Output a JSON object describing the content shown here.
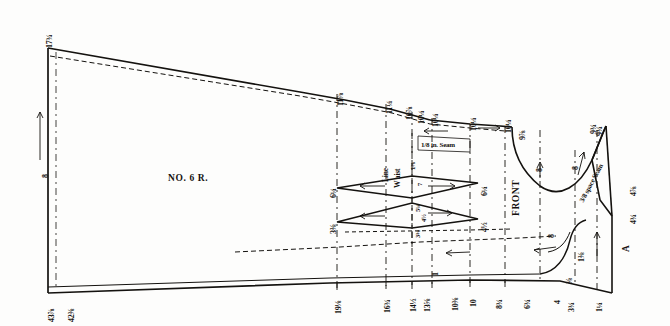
{
  "drawing": {
    "type": "tailoring-pattern-draft",
    "caption_text": "NO. 6 R.",
    "front_label": "FRONT",
    "waist_line_label_1": "W aist",
    "waist_line_label_2": "Line",
    "seam_label_top": "1/8 in. Seam",
    "seam_label_right": "3/8 space Seam",
    "point_a": "A"
  },
  "measurements": {
    "top_left": "17¾",
    "left_vertical": "8",
    "bottom_left_a": "43⅞",
    "bottom_left_b": "42⅜",
    "top_scale": [
      "11⅞",
      "11¼",
      "10⅞",
      "10¼",
      "10¼",
      "10¼",
      "10¼",
      "9⅞",
      "9¾"
    ],
    "bottom_scale": [
      "19⅛",
      "16¾",
      "14½",
      "13⅝",
      "1",
      "10⅜",
      "10",
      "8¾",
      "6¾",
      "4",
      "3¾",
      "1¼"
    ],
    "dart_left_upper": "6¼",
    "dart_left_lower": "3⅜",
    "dart_right_upper": "6¼",
    "dart_right_lower": "4½",
    "dart_inner_upper": "7",
    "dart_inner_lower_a": "5¼",
    "dart_inner_lower_b": "4½",
    "dart_inner_lower_c": "3⅜",
    "dart_mark_1": "1⅛",
    "dart_mark_2": "6¼",
    "armhole_8": "8",
    "armhole_8b": "8",
    "right_4_7_8": "4⅞",
    "right_4_3_4": "4¾",
    "right_1_3_8": "1⅜",
    "right_1_1_4": "1¼",
    "right_3_8": "⅜",
    "right_9_3_4": "9¾",
    "right_9_7_8": "9⅞",
    "neck_8": "8"
  },
  "colors": {
    "ink": "#14120f",
    "paper": "#fdfdfc",
    "rule": "#1a1a1a"
  }
}
